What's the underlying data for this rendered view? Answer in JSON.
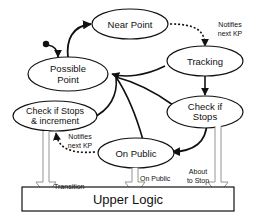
{
  "diagram": {
    "type": "state-machine",
    "states": [
      {
        "id": "near_point",
        "label": "Near Point"
      },
      {
        "id": "tracking",
        "label": "Tracking"
      },
      {
        "id": "possible_point",
        "label_line1": "Possible",
        "label_line2": "Point"
      },
      {
        "id": "check_if_stops",
        "label_line1": "Check if",
        "label_line2": "Stops"
      },
      {
        "id": "check_stops_increment",
        "label_line1": "Check if Stops",
        "label_line2": "& increment"
      },
      {
        "id": "on_public",
        "label": "On Public"
      }
    ],
    "edge_labels": {
      "notifies_top_line1": "Notifies",
      "notifies_top_line2": "next KP",
      "notifies_bottom_line1": "Notifies",
      "notifies_bottom_line2": "next KP",
      "transition": "Transition",
      "on_public": "On Public",
      "about_line1": "About",
      "about_line2": "to Stop"
    },
    "upper_logic": {
      "label": "Upper Logic"
    },
    "colors": {
      "line": "#111111",
      "hollow_arrow": "#888888",
      "background": "#ffffff"
    }
  }
}
